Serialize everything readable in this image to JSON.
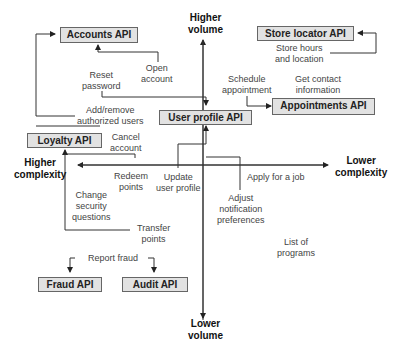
{
  "axes": {
    "top": [
      "Higher",
      "volume"
    ],
    "bottom": [
      "Lower",
      "volume"
    ],
    "left": [
      "Higher",
      "complexity"
    ],
    "right": [
      "Lower",
      "complexity"
    ]
  },
  "apis": {
    "accounts": "Accounts API",
    "store_locator": "Store locator API",
    "appointments": "Appointments API",
    "user_profile": "User profile API",
    "loyalty": "Loyalty API",
    "fraud": "Fraud API",
    "audit": "Audit API"
  },
  "actions": {
    "open_account": [
      "Open",
      "account"
    ],
    "reset_password": [
      "Reset",
      "password"
    ],
    "add_remove_users": [
      "Add/remove",
      "authorized users"
    ],
    "cancel_account": [
      "Cancel",
      "account"
    ],
    "store_hours": [
      "Store hours",
      "and location"
    ],
    "schedule_appointment": [
      "Schedule",
      "appointment"
    ],
    "get_contact": [
      "Get contact",
      "information"
    ],
    "redeem_points": [
      "Redeem",
      "points"
    ],
    "update_profile": [
      "Update",
      "user profile"
    ],
    "apply_job": [
      "Apply for a job"
    ],
    "adjust_notifications": [
      "Adjust",
      "notification",
      "preferences"
    ],
    "change_security": [
      "Change",
      "security",
      "questions"
    ],
    "transfer_points": [
      "Transfer",
      "points"
    ],
    "list_programs": [
      "List of",
      "programs"
    ],
    "report_fraud": [
      "Report fraud"
    ]
  }
}
